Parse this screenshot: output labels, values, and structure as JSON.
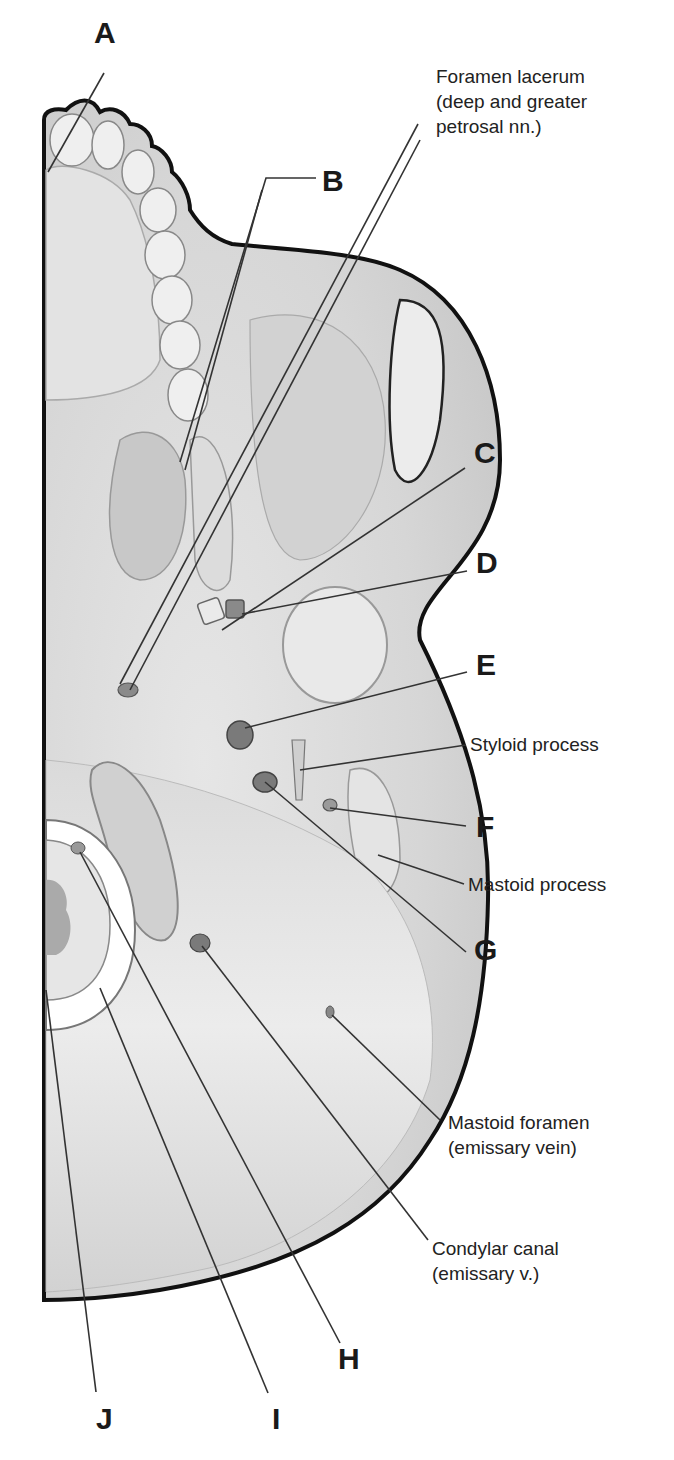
{
  "figure": {
    "colors": {
      "background": "#ffffff",
      "bone_fill": "#d9d9d9",
      "bone_light": "#ececec",
      "bone_shadow": "#b5b5b5",
      "outline": "#111111",
      "leader_line": "#333333",
      "label_text": "#1a1a1a"
    }
  },
  "letter_labels": [
    {
      "id": "A",
      "text": "A"
    },
    {
      "id": "B",
      "text": "B"
    },
    {
      "id": "C",
      "text": "C"
    },
    {
      "id": "D",
      "text": "D"
    },
    {
      "id": "E",
      "text": "E"
    },
    {
      "id": "F",
      "text": "F"
    },
    {
      "id": "G",
      "text": "G"
    },
    {
      "id": "H",
      "text": "H"
    },
    {
      "id": "I",
      "text": "I"
    },
    {
      "id": "J",
      "text": "J"
    }
  ],
  "text_labels": {
    "foramen_lacerum": {
      "line1": "Foramen lacerum",
      "line2": "(deep and greater",
      "line3": "petrosal nn.)"
    },
    "styloid_process": {
      "line1": "Styloid process"
    },
    "mastoid_process": {
      "line1": "Mastoid process"
    },
    "mastoid_foramen": {
      "line1": "Mastoid foramen",
      "line2": "(emissary vein)"
    },
    "condylar_canal": {
      "line1": "Condylar canal",
      "line2": "(emissary v.)"
    }
  }
}
